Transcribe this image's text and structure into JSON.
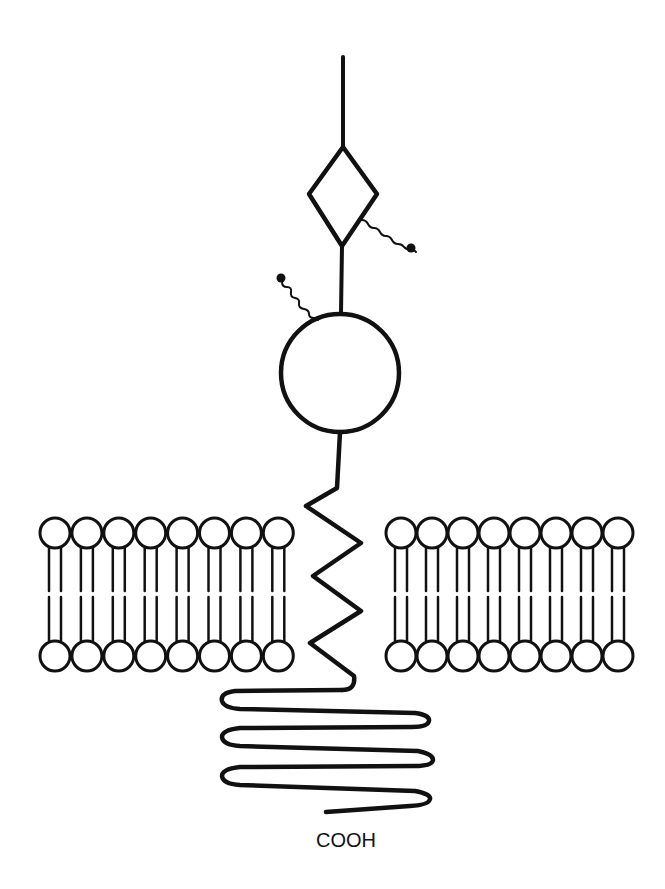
{
  "diagram": {
    "colors": {
      "ink": "#111111",
      "background": "#ffffff"
    },
    "labels": {
      "c_terminus": "COOH"
    },
    "parts": [
      {
        "id": "n-terminal-stalk",
        "shape": "line"
      },
      {
        "id": "diamond-domain",
        "shape": "diamond"
      },
      {
        "id": "glycan-chain-right",
        "shape": "wavy-line-with-dot"
      },
      {
        "id": "glycan-chain-left",
        "shape": "wavy-line-with-dot"
      },
      {
        "id": "globular-domain",
        "shape": "circle"
      },
      {
        "id": "transmembrane-helix",
        "shape": "zigzag"
      },
      {
        "id": "cytoplasmic-tail",
        "shape": "coil"
      }
    ],
    "membrane": {
      "left_block_lipids": 8,
      "right_block_lipids": 8,
      "leaflets": 2
    }
  }
}
